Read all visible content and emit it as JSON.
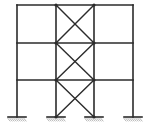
{
  "diagram": {
    "stroke_color": "#2b2b2b",
    "hatch_color": "#9a9a9a",
    "columns_x": [
      17,
      56,
      94,
      133
    ],
    "levels_y": [
      5,
      43,
      80,
      117
    ],
    "braced_bay": [
      56,
      94
    ],
    "supports": [
      {
        "x": 17,
        "type": "fixed"
      },
      {
        "x": 56,
        "type": "fixed"
      },
      {
        "x": 94,
        "type": "fixed"
      },
      {
        "x": 133,
        "type": "fixed"
      }
    ]
  }
}
